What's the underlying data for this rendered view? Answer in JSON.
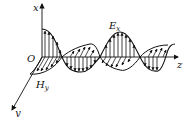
{
  "diagram": {
    "labels": {
      "x_axis": "x",
      "y_axis": "y",
      "z_axis": "z",
      "origin": "O",
      "e_field": "E",
      "e_field_sub": "x",
      "h_field": "H",
      "h_field_sub": "y"
    },
    "colors": {
      "stroke": "#111111",
      "background": "#ffffff"
    }
  }
}
